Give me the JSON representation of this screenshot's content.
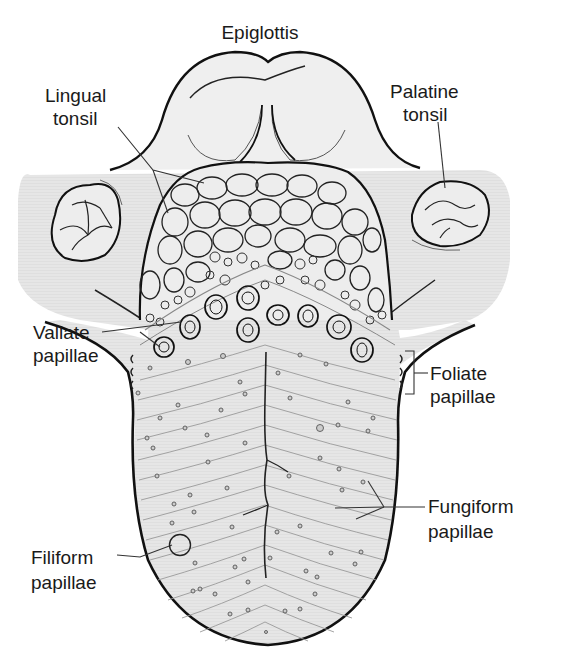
{
  "diagram": {
    "colors": {
      "outline": "#111111",
      "fine_line": "#6a6a6a",
      "tongue_fill": "#ececec",
      "tonsil_band": "#e4e4e4",
      "background": "#ffffff",
      "label_text": "#1a1a1a"
    },
    "labels": {
      "epiglottis": "Epiglottis",
      "lingual_tonsil_1": "Lingual",
      "lingual_tonsil_2": "tonsil",
      "palatine_tonsil_1": "Palatine",
      "palatine_tonsil_2": "tonsil",
      "vallate_1": "Vallate",
      "vallate_2": "papillae",
      "foliate_1": "Foliate",
      "foliate_2": "papillae",
      "fungiform_1": "Fungiform",
      "fungiform_2": "papillae",
      "filiform_1": "Filiform",
      "filiform_2": "papillae"
    },
    "structures": [
      "epiglottis",
      "lingual-tonsil",
      "palatine-tonsil-left",
      "palatine-tonsil-right",
      "vallate-papillae",
      "foliate-papillae",
      "fungiform-papillae",
      "filiform-papillae",
      "median-sulcus"
    ]
  }
}
